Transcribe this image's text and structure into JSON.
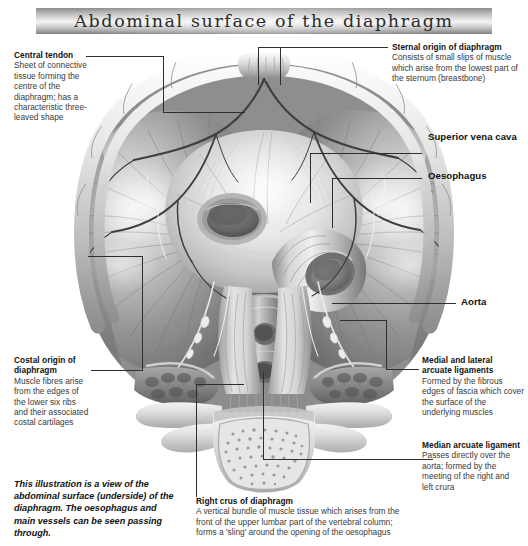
{
  "page": {
    "title": "Abdominal surface of the diaphragm",
    "background_color": "#ffffff",
    "banner_gradient_from": "#8d8d8d",
    "banner_gradient_to": "#7e7e7e",
    "leader_line_color": "#2e2e2e"
  },
  "illustration": {
    "name": "abdominal-surface-of-diaphragm",
    "style": "grayscale-anatomical-airbrush",
    "orientation": "inferior view (from below)",
    "structures": [
      "rib cage",
      "costal cartilages",
      "central tendon",
      "muscular diaphragm fibres",
      "caval opening",
      "oesophagus",
      "aorta",
      "right crus",
      "left crus",
      "median arcuate ligament",
      "medial arcuate ligament",
      "lateral arcuate ligament",
      "lumbar vertebral body",
      "psoas major",
      "quadratus lumborum",
      "phrenic vessels"
    ]
  },
  "labels": {
    "central_tendon": {
      "heading": "Central tendon",
      "body": "Sheet of connective tissue forming the centre of the diaphragm; has a characteristic three-leaved shape"
    },
    "sternal_origin": {
      "heading": "Sternal origin of diaphragm",
      "body": "Consists of small slips of muscle which arise from the lowest part of the sternum (breastbone)"
    },
    "superior_vena_cava": {
      "heading": "Superior vena cava",
      "body": ""
    },
    "oesophagus": {
      "heading": "Oesophagus",
      "body": ""
    },
    "aorta": {
      "heading": "Aorta",
      "body": ""
    },
    "costal_origin": {
      "heading": "Costal origin of diaphragm",
      "body": "Muscle fibres arise from the edges of the lower six ribs and their associated costal cartilages"
    },
    "arcuate_ligaments": {
      "heading": "Medial and lateral arcuate ligaments",
      "body": "Formed by the fibrous edges of fascia which cover the surface of the underlying muscles"
    },
    "median_arcuate_ligament": {
      "heading": "Median arcuate ligament",
      "body": "Passes directly over the aorta; formed by the meeting of the right and left crura"
    },
    "right_crus": {
      "heading": "Right crus of diaphragm",
      "body": "A vertical bundle of muscle tissue which arises from the front of the upper lumbar part of the vertebral column; forms a 'sling' around the opening of the oesophagus"
    }
  },
  "caption": {
    "text": "This illustration is a view of the abdominal surface (underside) of the diaphragm. The oesophagus and main vessels can be seen passing through."
  }
}
